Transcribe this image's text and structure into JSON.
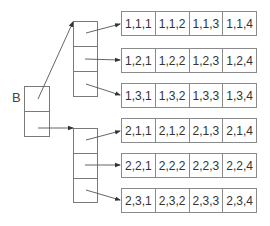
{
  "diagram": {
    "root_label": "B",
    "rows": [
      {
        "cells": [
          "1,1,1",
          "1,1,2",
          "1,1,3",
          "1,1,4"
        ]
      },
      {
        "cells": [
          "1,2,1",
          "1,2,2",
          "1,2,3",
          "1,2,4"
        ]
      },
      {
        "cells": [
          "1,3,1",
          "1,3,2",
          "1,3,3",
          "1,3,4"
        ]
      },
      {
        "cells": [
          "2,1,1",
          "2,1,2",
          "2,1,3",
          "2,1,4"
        ]
      },
      {
        "cells": [
          "2,2,1",
          "2,2,2",
          "2,2,3",
          "2,2,4"
        ]
      },
      {
        "cells": [
          "2,3,1",
          "2,3,2",
          "2,3,3",
          "2,3,4"
        ]
      }
    ],
    "colors": {
      "line": "#7a7a7a",
      "text": "#333333",
      "arrow": "#333333"
    }
  }
}
